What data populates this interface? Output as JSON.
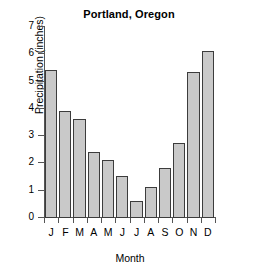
{
  "chart_data": {
    "type": "bar",
    "title": "Portland, Oregon",
    "xlabel": "Month",
    "ylabel": "Precipitation (inches)",
    "categories": [
      "J",
      "F",
      "M",
      "A",
      "M",
      "J",
      "J",
      "A",
      "S",
      "O",
      "N",
      "D"
    ],
    "category_names": [
      "January",
      "February",
      "March",
      "April",
      "May",
      "June",
      "July",
      "August",
      "September",
      "October",
      "November",
      "December"
    ],
    "values": [
      5.4,
      3.9,
      3.6,
      2.4,
      2.1,
      1.5,
      0.6,
      1.1,
      1.8,
      2.7,
      5.3,
      6.1
    ],
    "ylim": [
      0,
      7
    ],
    "yticks": [
      0,
      1,
      2,
      3,
      4,
      5,
      6,
      7
    ],
    "ytick_labels": [
      "0",
      "1",
      "2",
      "3",
      "4",
      "5",
      "6",
      "7"
    ],
    "grid": false,
    "legend": null,
    "bar_fill_color": "#c9c9c9",
    "bar_edge_color": "#3c3c3c",
    "axis_color": "#555555",
    "background_color": "#ffffff"
  }
}
